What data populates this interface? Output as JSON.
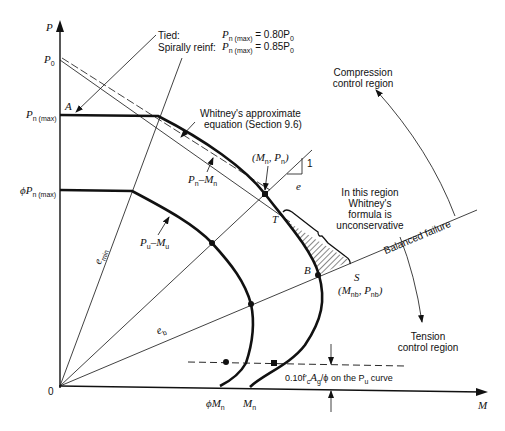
{
  "axes": {
    "y_label": "P",
    "x_label": "M",
    "origin_label": "0"
  },
  "y_ticks": {
    "p0": {
      "main": "P",
      "sub": "0"
    },
    "pn_max": {
      "main": "P",
      "sub": "n (max)"
    },
    "phi_pn_max": {
      "prefix": "ϕP",
      "sub": "n (max)"
    }
  },
  "x_ticks": {
    "phi_mn": {
      "main": "ϕM",
      "sub": "n"
    },
    "mn": {
      "main": "M",
      "sub": "n"
    }
  },
  "limits_note": {
    "tied_label": "Tied:",
    "tied_value": "= 0.80P",
    "tied_sub": "0",
    "spiral_label": "Spirally reinf:",
    "spiral_value": "= 0.85P",
    "spiral_sub": "0",
    "pn_main": "P",
    "pn_sub": "n (max)"
  },
  "points": {
    "A": "A",
    "T": "T",
    "B": "B",
    "S": "S",
    "mn_pn": "(M",
    "mn_pn_sub1": "n",
    "mn_pn_mid": ", P",
    "mn_pn_sub2": "n",
    "mn_pn_end": ")",
    "mnb_pnb": "(M",
    "mnb_sub1": "nb",
    "mnb_mid": ", P",
    "mnb_sub2": "nb",
    "mnb_end": ")"
  },
  "curve_labels": {
    "pn_mn": {
      "a": "P",
      "a_sub": "n",
      "dash": "–M",
      "b_sub": "n"
    },
    "pu_mu": {
      "a": "P",
      "a_sub": "u",
      "dash": "–M",
      "b_sub": "u"
    }
  },
  "line_labels": {
    "e_min": "e",
    "e_min_sub": "min",
    "e_b": "e",
    "e_b_sub": "b",
    "e": "e",
    "slope_one": "1",
    "balanced": "Balanced failure"
  },
  "annotations": {
    "whitney_line1": "Whitney's approximate",
    "whitney_line2": "equation (Section 9.6)",
    "region_line1": "In this region",
    "region_line2": "Whitney's",
    "region_line3": "formula is",
    "region_line4": "unconservative",
    "compression_line1": "Compression",
    "compression_line2": "control region",
    "tension_line1": "Tension",
    "tension_line2": "control region",
    "threshold_pre": "0.10f′",
    "threshold_c": "c",
    "threshold_mid": "A",
    "threshold_g": "g",
    "threshold_post": "/ϕ on the P",
    "threshold_u": "u",
    "threshold_end": " curve"
  }
}
